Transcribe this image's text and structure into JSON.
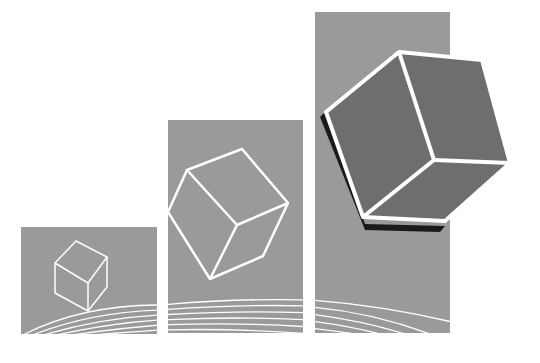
{
  "illustration": {
    "subject": "three ascending gray bars with cubes growing in size",
    "colors": {
      "background": "#ffffff",
      "bar": "#9a9a9a",
      "cube_outline": "#ffffff",
      "large_cube_face": "#6e6e6e",
      "large_cube_shadow": "#1a1a1a"
    },
    "bars": [
      {
        "label": "small-bar",
        "x": 21,
        "y": 227,
        "w": 136,
        "h": 107
      },
      {
        "label": "medium-bar",
        "x": 168,
        "y": 120,
        "w": 135,
        "h": 213
      },
      {
        "label": "large-bar",
        "x": 315,
        "y": 12,
        "w": 135,
        "h": 321
      }
    ]
  }
}
